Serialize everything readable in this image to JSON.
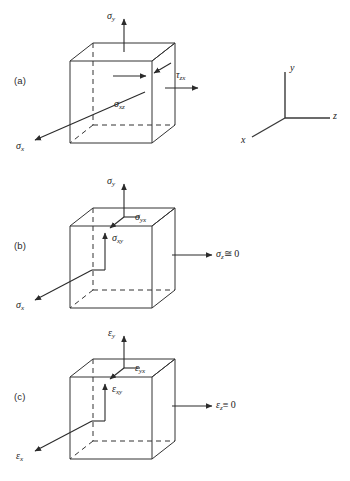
{
  "figure": {
    "background_color": "#ffffff",
    "line_color": "#333333",
    "panels": [
      {
        "id": "a",
        "label": "(a)",
        "description": "Three-dimensional general stress state on a cubic element",
        "labels": [
          {
            "name": "sigma-y",
            "base": "σ",
            "sub": "y"
          },
          {
            "name": "tau-zx",
            "base": "τ",
            "sub": "zx"
          },
          {
            "name": "sigma-xz",
            "base": "σ",
            "sub": "xz"
          },
          {
            "name": "sigma-x",
            "base": "σ",
            "sub": "x"
          }
        ]
      },
      {
        "id": "b",
        "label": "(b)",
        "description": "Plane stress state on a cubic element",
        "labels": [
          {
            "name": "sigma-y",
            "base": "σ",
            "sub": "y"
          },
          {
            "name": "sigma-yx",
            "base": "σ",
            "sub": "yx"
          },
          {
            "name": "sigma-xy",
            "base": "σ",
            "sub": "xy"
          },
          {
            "name": "sigma-x",
            "base": "σ",
            "sub": "x"
          },
          {
            "name": "sigma-z-zero",
            "base": "σ",
            "sub": "z",
            "suffix": "≅ 0"
          }
        ]
      },
      {
        "id": "c",
        "label": "(c)",
        "description": "Plane strain state on a cubic element",
        "labels": [
          {
            "name": "epsilon-y",
            "base": "ε",
            "sub": "y"
          },
          {
            "name": "epsilon-yx",
            "base": "ε",
            "sub": "yx"
          },
          {
            "name": "epsilon-xy",
            "base": "ε",
            "sub": "xy"
          },
          {
            "name": "epsilon-x",
            "base": "ε",
            "sub": "x"
          },
          {
            "name": "epsilon-z-zero",
            "base": "ε",
            "sub": "z",
            "suffix": "≡ 0"
          }
        ]
      }
    ],
    "axes_triad": {
      "name": "coordinate-axes",
      "y_label": "y",
      "z_label": "z",
      "x_label": "x"
    }
  },
  "panel_a": {
    "label": "(a)",
    "sigma_y": "σ",
    "sigma_y_sub": "y",
    "tau_zx": "τ",
    "tau_zx_sub": "zx",
    "sigma_xz": "σ",
    "sigma_xz_sub": "xz",
    "sigma_x": "σ",
    "sigma_x_sub": "x"
  },
  "panel_b": {
    "label": "(b)",
    "sigma_y": "σ",
    "sigma_y_sub": "y",
    "sigma_yx": "σ",
    "sigma_yx_sub": "yx",
    "sigma_xy": "σ",
    "sigma_xy_sub": "xy",
    "sigma_x": "σ",
    "sigma_x_sub": "x",
    "sigma_z": "σ",
    "sigma_z_sub": "z",
    "sigma_z_value": "≅ 0"
  },
  "panel_c": {
    "label": "(c)",
    "epsilon_y": "ε",
    "epsilon_y_sub": "y",
    "epsilon_yx": "ε",
    "epsilon_yx_sub": "yx",
    "epsilon_xy": "ε",
    "epsilon_xy_sub": "xy",
    "epsilon_x": "ε",
    "epsilon_x_sub": "x",
    "epsilon_z": "ε",
    "epsilon_z_sub": "z",
    "epsilon_z_value": "≡ 0"
  },
  "axes": {
    "y": "y",
    "z": "z",
    "x": "x"
  }
}
